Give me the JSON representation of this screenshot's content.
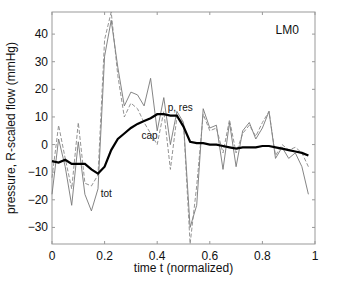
{
  "chart_data": {
    "type": "line",
    "title": "",
    "xlabel": "time t (normalized)",
    "ylabel": "pressure, R-scaled flow (mmHg)",
    "xlim": [
      0,
      1
    ],
    "ylim": [
      -36,
      48
    ],
    "xticks": [
      0,
      0.2,
      0.4,
      0.6,
      0.8,
      1
    ],
    "xtick_labels": [
      "0",
      "0.2",
      "0.4",
      "0.6",
      "0.8",
      "1"
    ],
    "yticks": [
      -30,
      -20,
      -10,
      0,
      10,
      20,
      30,
      40
    ],
    "ytick_labels": [
      "-30",
      "-20",
      "-10",
      "0",
      "10",
      "20",
      "30",
      "40"
    ],
    "grid": false,
    "legend": null,
    "annotations": [
      {
        "text": "LM0",
        "x": 0.85,
        "y": 40
      },
      {
        "text": "p, res",
        "x": 0.44,
        "y": 12
      },
      {
        "text": "cap",
        "x": 0.34,
        "y": 2
      },
      {
        "text": "tot",
        "x": 0.185,
        "y": -19
      }
    ],
    "x": [
      0,
      0.025,
      0.05,
      0.075,
      0.1,
      0.125,
      0.15,
      0.175,
      0.2,
      0.225,
      0.25,
      0.275,
      0.3,
      0.325,
      0.35,
      0.375,
      0.4,
      0.425,
      0.45,
      0.475,
      0.5,
      0.525,
      0.55,
      0.575,
      0.6,
      0.625,
      0.65,
      0.675,
      0.7,
      0.725,
      0.75,
      0.775,
      0.8,
      0.825,
      0.85,
      0.875,
      0.9,
      0.925,
      0.95,
      0.975
    ],
    "series": [
      {
        "name": "p, res",
        "style": "solid-thick",
        "color": "#000000",
        "values": [
          -6,
          -6.5,
          -5.5,
          -7,
          -7,
          -7,
          -9,
          -10.5,
          -8,
          -2,
          2,
          4,
          6,
          7.5,
          8.5,
          9.5,
          11,
          11,
          10.5,
          10.5,
          6.5,
          1,
          0.5,
          0.5,
          0,
          0,
          -0.5,
          -1,
          -1.5,
          -1,
          -1,
          -1,
          -0.5,
          -0.5,
          -1,
          -1.5,
          -2,
          -2.5,
          -3,
          -4
        ]
      },
      {
        "name": "tot",
        "style": "solid-thin",
        "color": "#777777",
        "values": [
          -18,
          2,
          -8,
          -22,
          1,
          -18,
          -24,
          -16,
          32,
          45,
          28,
          14,
          19,
          18,
          14,
          24,
          5,
          17,
          0,
          12,
          8,
          -30,
          -22,
          13,
          6,
          7,
          -9,
          8,
          -8,
          5,
          8,
          2,
          6,
          12,
          -5,
          -1,
          -5,
          -3,
          -8,
          -18
        ]
      },
      {
        "name": "cap",
        "style": "dashed",
        "color": "#888888",
        "values": [
          -12,
          7,
          -5,
          -16,
          8,
          -14,
          -15,
          -11,
          38,
          48,
          25,
          10,
          15,
          13,
          8,
          4,
          0,
          12,
          -9,
          10,
          8,
          -36,
          -15,
          11,
          5,
          6,
          -3,
          9,
          -3,
          4,
          7,
          3,
          8,
          12,
          -4,
          0,
          -2,
          -1,
          -3,
          -8
        ]
      }
    ]
  }
}
